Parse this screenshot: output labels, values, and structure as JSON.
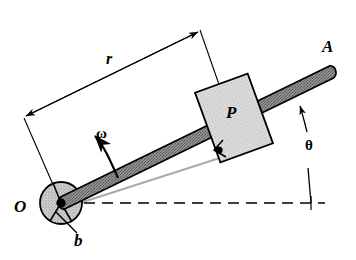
{
  "figure": {
    "kind": "mechanism-diagram",
    "background_color": "#ffffff",
    "stroke_color": "#000000"
  },
  "labels": {
    "pivot": "O",
    "rod_end": "A",
    "slider": "P",
    "offset": "b",
    "radius": "r",
    "angular_velocity": "ω",
    "angle": "θ"
  },
  "colors": {
    "rod_fill": "#8c8c8c",
    "rod_stroke": "#000000",
    "slider_fill": "#d8d8d8",
    "slider_stroke": "#000000",
    "hub_fill": "#c9c9c9",
    "hub_stroke": "#000000",
    "reference_line": "#a6a6a6",
    "dashed_line": "#000000"
  },
  "geometry": {
    "pivot_point": {
      "x": 61,
      "y": 203
    },
    "rod_tip_point": {
      "x": 330,
      "y": 72
    },
    "hub_radius": 21,
    "rod_half_width": 7,
    "rod_angle_deg": -26,
    "slider_center": {
      "x": 234,
      "y": 118
    },
    "slider_width": 56,
    "slider_height": 74,
    "slider_rotation_deg": -20,
    "pin_point": {
      "x": 218,
      "y": 150
    },
    "dashed_line_y": 203,
    "dashed_line_x_start": 66,
    "dashed_line_x_end": 325,
    "theta_vertical_x": 311,
    "dimension_left_end": {
      "x": 24,
      "y": 118
    },
    "dimension_right_end": {
      "x": 200,
      "y": 30
    }
  },
  "annotations": {
    "dimension_name": "r",
    "rotation_sense": "counterclockwise",
    "angle_measured_from": "horizontal dashed reference line"
  }
}
